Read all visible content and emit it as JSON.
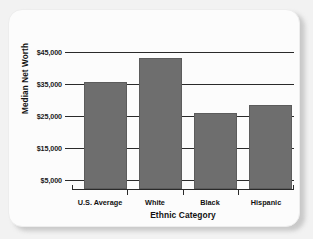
{
  "chart_data": {
    "type": "bar",
    "title": "",
    "categories": [
      "U.S. Average",
      "White",
      "Black",
      "Hispanic"
    ],
    "values": [
      35000,
      43000,
      25000,
      27500
    ],
    "xlabel": "Ethnic Category",
    "ylabel": "Median Net Worth",
    "ylim": [
      0,
      45000
    ],
    "ytick_labels": [
      "$45,000",
      "$35,000",
      "$25,000",
      "$15,000",
      "$5,000"
    ],
    "ytick_values": [
      45000,
      35000,
      25000,
      15000,
      5000
    ],
    "grid": true,
    "legend": "none",
    "bar_color": "#6e6e6e",
    "axis_color": "#2a2a2a",
    "background_color": "#fcfcfc"
  }
}
